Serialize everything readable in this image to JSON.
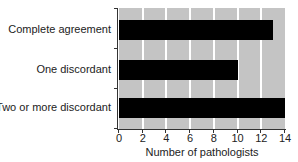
{
  "chart_data": {
    "type": "bar",
    "orientation": "horizontal",
    "categories": [
      "Complete agreement",
      "One discordant",
      "Two or more discordant"
    ],
    "values": [
      13,
      10,
      14
    ],
    "title": "",
    "xlabel": "Number of pathologists",
    "ylabel": "",
    "xlim": [
      0,
      14
    ],
    "xticks": [
      "0",
      "2",
      "4",
      "6",
      "8",
      "10",
      "12",
      "14"
    ],
    "grid": true,
    "legend": null,
    "colors": {
      "bar": "#000000",
      "plot_background": "#c4c4c4",
      "gridlines": "#ffffff"
    }
  }
}
